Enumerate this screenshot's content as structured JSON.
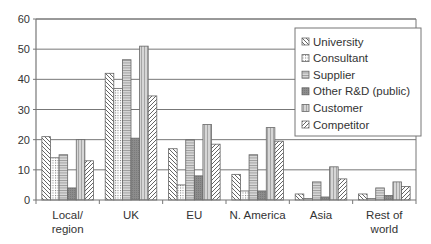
{
  "chart_data": {
    "type": "bar",
    "title": "",
    "xlabel": "",
    "ylabel": "",
    "ylim": [
      0,
      60
    ],
    "yticks": [
      0,
      10,
      20,
      30,
      40,
      50,
      60
    ],
    "grid": true,
    "legend_position": "upper right (inside plot)",
    "categories": [
      "Local/\nregion",
      "UK",
      "EU",
      "N. America",
      "Asia",
      "Rest of\nworld"
    ],
    "series": [
      {
        "name": "University",
        "pattern": "diagonal-down",
        "values": [
          21,
          42,
          17,
          8.5,
          2,
          2
        ]
      },
      {
        "name": "Consultant",
        "pattern": "dots",
        "values": [
          14,
          37,
          5,
          3,
          0.5,
          0.5
        ]
      },
      {
        "name": "Supplier",
        "pattern": "horizontal-lines",
        "values": [
          15,
          46.5,
          20,
          15,
          6,
          4
        ]
      },
      {
        "name": "Other R&D (public)",
        "pattern": "dark-grey",
        "values": [
          4,
          20.5,
          8,
          3,
          1,
          1.5
        ]
      },
      {
        "name": "Customer",
        "pattern": "vertical-lines",
        "values": [
          20,
          51,
          25,
          24,
          11,
          6
        ]
      },
      {
        "name": "Competitor",
        "pattern": "diagonal-up",
        "values": [
          13,
          34.5,
          18.5,
          19.5,
          7,
          4.5
        ]
      }
    ]
  },
  "colors": {
    "axis": "#777777",
    "grid": "#777777",
    "bar_border": "#666666",
    "text": "#333333"
  }
}
